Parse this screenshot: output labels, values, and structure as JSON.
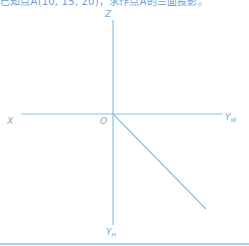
{
  "caption": "已知点A(10, 15, 20)，求作点A的三面投影。",
  "axes": {
    "z_label": "Z",
    "x_label": "X",
    "origin_label": "O",
    "yw_label": "Y",
    "yw_sub": "W",
    "yh_label": "Y",
    "yh_sub": "H"
  },
  "colors": {
    "line": "#8cbfe6",
    "label": "#7aa9d6",
    "caption": "#4a8fd0"
  }
}
